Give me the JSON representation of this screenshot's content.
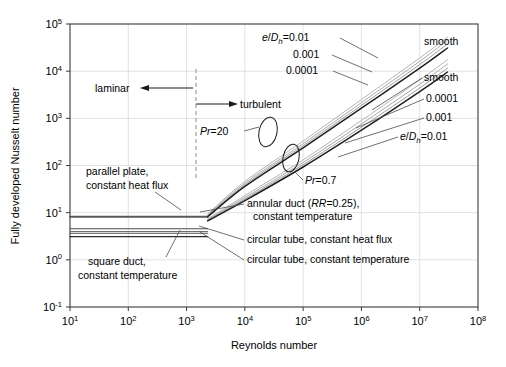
{
  "figure": {
    "background": "#ffffff",
    "frame_color": "#3a3a3a",
    "grid_color": "#d9d9d9"
  },
  "chart_data": {
    "type": "line",
    "title": "",
    "xlabel": "Reynolds number",
    "ylabel": "Fully developed Nusselt number",
    "xscale": "log",
    "yscale": "log",
    "xlim": [
      10,
      100000000
    ],
    "ylim": [
      0.1,
      100000
    ],
    "xticks": [
      10,
      100,
      1000,
      10000,
      100000,
      1000000,
      10000000,
      100000000
    ],
    "xtick_labels": [
      "10^1",
      "10^2",
      "10^3",
      "10^4",
      "10^5",
      "10^6",
      "10^7",
      "10^8"
    ],
    "xtick_mantissas": [
      "10",
      "10",
      "10",
      "10",
      "10",
      "10",
      "10",
      "10"
    ],
    "xtick_exponents": [
      "1",
      "2",
      "3",
      "4",
      "5",
      "6",
      "7",
      "8"
    ],
    "yticks": [
      0.1,
      1,
      10,
      100,
      1000,
      10000,
      100000
    ],
    "ytick_labels": [
      "10^-1",
      "10^0",
      "10^1",
      "10^2",
      "10^3",
      "10^4",
      "10^5"
    ],
    "ytick_mantissas": [
      "10",
      "10",
      "10",
      "10",
      "10",
      "10",
      "10"
    ],
    "ytick_exponents": [
      "-1",
      "0",
      "1",
      "2",
      "3",
      "4",
      "5"
    ],
    "grid": true,
    "legend": "annotations-inline",
    "transition_reynolds": 2300,
    "regions": [
      {
        "name": "laminar",
        "label": "laminar",
        "x_range": [
          10,
          2300
        ]
      },
      {
        "name": "turbulent",
        "label": "turbulent",
        "x_range": [
          2300,
          100000000
        ]
      }
    ],
    "laminar_series": [
      {
        "name": "parallel plate, constant heat flux",
        "nusselt": 8.23,
        "color": "#595959",
        "width": 2.0
      },
      {
        "name": "annular duct (RR=0.25), constant temperature",
        "nusselt": 4.55,
        "color": "#4d4d4d",
        "width": 1.1
      },
      {
        "name": "square duct, constant temperature",
        "nusselt": 4.0,
        "color": "#6e6e6e",
        "width": 1.1
      },
      {
        "name": "circular tube, constant heat flux",
        "nusselt": 3.66,
        "color": "#555555",
        "width": 1.1
      },
      {
        "name": "circular tube, constant temperature",
        "nusselt": 3.1,
        "color": "#2b2b2b",
        "width": 1.3
      }
    ],
    "turbulent_series": [
      {
        "name": "Pr=20, e/Dh=0.01",
        "prandtl": 20,
        "roughness": "0.01",
        "color": "#b5b5b5",
        "width": 1.0,
        "points": [
          [
            2300,
            9.4
          ],
          [
            10000.0,
            46
          ],
          [
            100000.0,
            330
          ],
          [
            1000000.0,
            2500
          ],
          [
            10000000.0,
            19000
          ],
          [
            30000000.0,
            53000
          ]
        ]
      },
      {
        "name": "Pr=20, e/Dh=0.001",
        "prandtl": 20,
        "roughness": "0.001",
        "color": "#a8a8a8",
        "width": 1.0,
        "points": [
          [
            2300,
            9.0
          ],
          [
            10000.0,
            42
          ],
          [
            100000.0,
            290
          ],
          [
            1000000.0,
            2150
          ],
          [
            10000000.0,
            16200
          ],
          [
            30000000.0,
            45000
          ]
        ]
      },
      {
        "name": "Pr=20, e/Dh=0.0001",
        "prandtl": 20,
        "roughness": "0.0001",
        "color": "#9a9a9a",
        "width": 1.0,
        "points": [
          [
            2300,
            8.6
          ],
          [
            10000.0,
            39
          ],
          [
            100000.0,
            262
          ],
          [
            1000000.0,
            1880
          ],
          [
            10000000.0,
            13800
          ],
          [
            30000000.0,
            38000
          ]
        ]
      },
      {
        "name": "Pr=20, smooth",
        "prandtl": 20,
        "roughness": "smooth",
        "color": "#1f1f1f",
        "width": 1.5,
        "points": [
          [
            2300,
            8.2
          ],
          [
            10000.0,
            36
          ],
          [
            100000.0,
            236
          ],
          [
            1000000.0,
            1640
          ],
          [
            10000000.0,
            11600
          ],
          [
            30000000.0,
            31000
          ]
        ]
      },
      {
        "name": "Pr=0.7, e/Dh=0.01",
        "prandtl": 0.7,
        "roughness": "0.01",
        "color": "#b5b5b5",
        "width": 1.0,
        "points": [
          [
            2300,
            7.4
          ],
          [
            10000.0,
            23
          ],
          [
            100000.0,
            132
          ],
          [
            1000000.0,
            900
          ],
          [
            10000000.0,
            6500
          ],
          [
            30000000.0,
            17500
          ]
        ]
      },
      {
        "name": "Pr=0.7, e/Dh=0.001",
        "prandtl": 0.7,
        "roughness": "0.001",
        "color": "#a8a8a8",
        "width": 1.0,
        "points": [
          [
            2300,
            7.1
          ],
          [
            10000.0,
            21
          ],
          [
            100000.0,
            116
          ],
          [
            1000000.0,
            760
          ],
          [
            10000000.0,
            5300
          ],
          [
            30000000.0,
            14200
          ]
        ]
      },
      {
        "name": "Pr=0.7, e/Dh=0.0001",
        "prandtl": 0.7,
        "roughness": "0.0001",
        "color": "#9a9a9a",
        "width": 1.0,
        "points": [
          [
            2300,
            6.9
          ],
          [
            10000.0,
            19.5
          ],
          [
            100000.0,
            104
          ],
          [
            1000000.0,
            650
          ],
          [
            10000000.0,
            4400
          ],
          [
            30000000.0,
            11600
          ]
        ]
      },
      {
        "name": "Pr=0.7, smooth",
        "prandtl": 0.7,
        "roughness": "smooth",
        "color": "#1f1f1f",
        "width": 1.5,
        "points": [
          [
            2300,
            6.7
          ],
          [
            10000.0,
            18
          ],
          [
            100000.0,
            93
          ],
          [
            1000000.0,
            560
          ],
          [
            10000000.0,
            3700
          ],
          [
            30000000.0,
            9600
          ]
        ]
      }
    ],
    "annotations": [
      {
        "id": "laminar",
        "text": "laminar"
      },
      {
        "id": "turbulent",
        "text": "turbulent"
      },
      {
        "id": "pr20",
        "text_parts": {
          "italic": "Pr",
          "rest": "=20"
        }
      },
      {
        "id": "pr07",
        "text_parts": {
          "italic": "Pr",
          "rest": "=0.7"
        }
      },
      {
        "id": "edh-top",
        "text_parts": {
          "italic_a": "e",
          "slash": "/",
          "italic_b": "D",
          "sub": "h",
          "rest": "=0.01"
        }
      },
      {
        "id": "edh-top-2",
        "text": "0.001"
      },
      {
        "id": "edh-top-3",
        "text": "0.0001"
      },
      {
        "id": "smooth-top",
        "text": "smooth"
      },
      {
        "id": "smooth-mid",
        "text": "smooth"
      },
      {
        "id": "edh-bot-3",
        "text": "0.0001"
      },
      {
        "id": "edh-bot-2",
        "text": "0.001"
      },
      {
        "id": "edh-bot",
        "text_parts": {
          "italic_a": "e",
          "slash": "/",
          "italic_b": "D",
          "sub": "h",
          "rest": "=0.01"
        }
      },
      {
        "id": "parallel-plate",
        "line1": "parallel plate,",
        "line2": "constant heat flux"
      },
      {
        "id": "square-duct",
        "line1": "square duct,",
        "line2": "constant temperature"
      },
      {
        "id": "annular-duct",
        "line1_a": "annular duct (",
        "line1_italic": "RR",
        "line1_b": "=0.25),",
        "line2": "constant temperature"
      },
      {
        "id": "circular-flux",
        "text": "circular tube, constant heat flux"
      },
      {
        "id": "circular-temp",
        "text": "circular tube, constant temperature"
      }
    ]
  }
}
